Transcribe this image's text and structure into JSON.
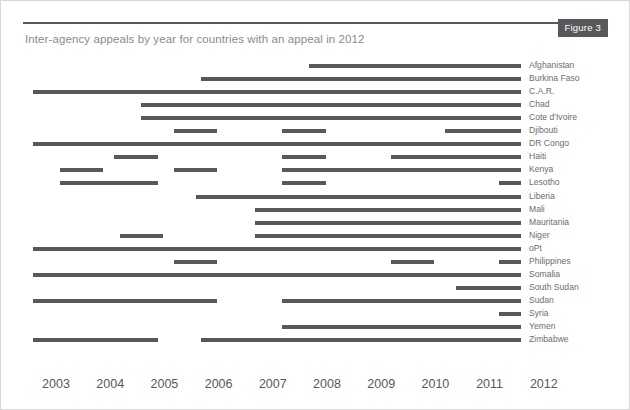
{
  "figure": {
    "badge_label": "Figure 3",
    "title": "Inter-agency appeals by year for countries with an appeal in 2012",
    "accent_color": "#58585a",
    "title_color": "#8a8a8c",
    "label_color": "#6d6d70",
    "border_color": "#d8d8d8",
    "background_color": "#ffffff"
  },
  "chart_data": {
    "type": "bar",
    "title": "Inter-agency appeals by year for countries with an appeal in 2012",
    "subtitle": "Figure 3",
    "xlabel": "",
    "ylabel": "",
    "orientation": "horizontal",
    "grid": false,
    "legend": "none",
    "note": "Gantt-style presence chart: each horizontal segment marks the span of years in which the country had an inter-agency appeal.",
    "xlim": [
      2003,
      2012
    ],
    "x_ticks": [
      "2003",
      "2004",
      "2005",
      "2006",
      "2007",
      "2008",
      "2009",
      "2010",
      "2011",
      "2012"
    ],
    "categories": [
      "Afghanistan",
      "Burkina Faso",
      "C.A.R.",
      "Chad",
      "Cote d'Ivoire",
      "Djibouti",
      "DR Congo",
      "Haiti",
      "Kenya",
      "Lesotho",
      "Liberia",
      "Mali",
      "Mauritania",
      "Niger",
      "oPt",
      "Philippines",
      "Somalia",
      "South Sudan",
      "Sudan",
      "Syria",
      "Yemen",
      "Zimbabwe"
    ],
    "series": [
      {
        "name": "Afghanistan",
        "spans": [
          [
            2008.1,
            2012.0
          ]
        ]
      },
      {
        "name": "Burkina Faso",
        "spans": [
          [
            2006.1,
            2012.0
          ]
        ]
      },
      {
        "name": "C.A.R.",
        "spans": [
          [
            2003.0,
            2012.0
          ]
        ]
      },
      {
        "name": "Chad",
        "spans": [
          [
            2005.0,
            2012.0
          ]
        ]
      },
      {
        "name": "Cote d'Ivoire",
        "spans": [
          [
            2005.0,
            2012.0
          ]
        ]
      },
      {
        "name": "Djibouti",
        "spans": [
          [
            2005.6,
            2006.4
          ],
          [
            2007.6,
            2008.4
          ],
          [
            2010.6,
            2012.0
          ]
        ]
      },
      {
        "name": "DR Congo",
        "spans": [
          [
            2003.0,
            2012.0
          ]
        ]
      },
      {
        "name": "Haiti",
        "spans": [
          [
            2004.5,
            2005.3
          ],
          [
            2007.6,
            2008.4
          ],
          [
            2009.6,
            2012.0
          ]
        ]
      },
      {
        "name": "Kenya",
        "spans": [
          [
            2003.5,
            2004.3
          ],
          [
            2005.6,
            2006.4
          ],
          [
            2007.6,
            2012.0
          ]
        ]
      },
      {
        "name": "Lesotho",
        "spans": [
          [
            2003.5,
            2005.3
          ],
          [
            2007.6,
            2008.4
          ],
          [
            2011.6,
            2012.0
          ]
        ]
      },
      {
        "name": "Liberia",
        "spans": [
          [
            2006.0,
            2012.0
          ]
        ]
      },
      {
        "name": "Mali",
        "spans": [
          [
            2007.1,
            2012.0
          ]
        ]
      },
      {
        "name": "Mauritania",
        "spans": [
          [
            2007.1,
            2012.0
          ]
        ]
      },
      {
        "name": "Niger",
        "spans": [
          [
            2004.6,
            2005.4
          ],
          [
            2007.1,
            2012.0
          ]
        ]
      },
      {
        "name": "oPt",
        "spans": [
          [
            2003.0,
            2012.0
          ]
        ]
      },
      {
        "name": "Philippines",
        "spans": [
          [
            2005.6,
            2006.4
          ],
          [
            2009.6,
            2010.4
          ],
          [
            2011.6,
            2012.0
          ]
        ]
      },
      {
        "name": "Somalia",
        "spans": [
          [
            2003.0,
            2012.0
          ]
        ]
      },
      {
        "name": "South Sudan",
        "spans": [
          [
            2010.8,
            2012.0
          ]
        ]
      },
      {
        "name": "Sudan",
        "spans": [
          [
            2003.0,
            2006.4
          ],
          [
            2007.6,
            2012.0
          ]
        ]
      },
      {
        "name": "Syria",
        "spans": [
          [
            2011.6,
            2012.0
          ]
        ]
      },
      {
        "name": "Yemen",
        "spans": [
          [
            2007.6,
            2012.0
          ]
        ]
      },
      {
        "name": "Zimbabwe",
        "spans": [
          [
            2003.0,
            2005.3
          ],
          [
            2006.1,
            2012.0
          ]
        ]
      }
    ]
  }
}
